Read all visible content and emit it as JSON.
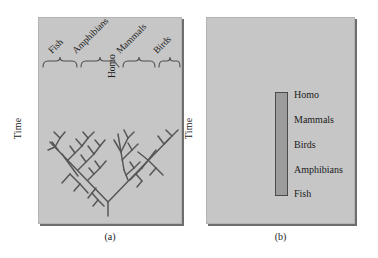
{
  "figure": {
    "panel_a": {
      "caption": "(a)",
      "axis_label": "Time",
      "group_labels": [
        "Fish",
        "Amphibians",
        "Mammals",
        "Birds"
      ],
      "inner_label": "Homo",
      "brace_count": 4,
      "diagram_type": "branching-phylogenetic-tree"
    },
    "panel_b": {
      "caption": "(b)",
      "axis_label": "Time",
      "bar_labels": [
        "Homo",
        "Mammals",
        "Birds",
        "Amphibians",
        "Fish"
      ],
      "diagram_type": "linear-scale-of-nature"
    }
  },
  "colors": {
    "panel_background": "#c6c6c6",
    "panel_shadow": "#6e6e6e",
    "bar_fill": "#9c9c9c",
    "bar_stroke": "#4a4a4a",
    "ink": "#1b1b1b",
    "tree_stroke": "#565656",
    "page_background": "#ffffff"
  }
}
